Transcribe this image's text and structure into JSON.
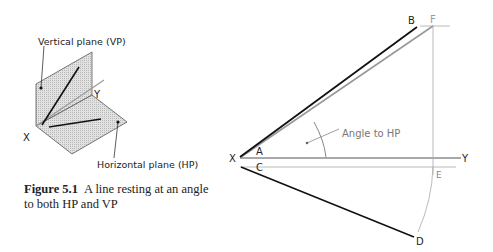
{
  "figure": {
    "number": "Figure 5.1",
    "caption": "A line resting at an angle to both HP and VP"
  },
  "left_diagram": {
    "labels": {
      "vertical_plane": "Vertical plane (VP)",
      "horizontal_plane": "Horizontal plane (HP)",
      "x": "X",
      "y": "Y"
    }
  },
  "right_diagram": {
    "points": {
      "A": "A",
      "B": "B",
      "C": "C",
      "D": "D",
      "E": "E",
      "F": "F"
    },
    "axis": {
      "x": "X",
      "y": "Y"
    },
    "annotation": "Angle to HP"
  },
  "colors": {
    "line_dark": "#1a1a1a",
    "line_grey": "#9a9a9a",
    "plane_fill": "#d4d4d4",
    "text": "#222222"
  }
}
